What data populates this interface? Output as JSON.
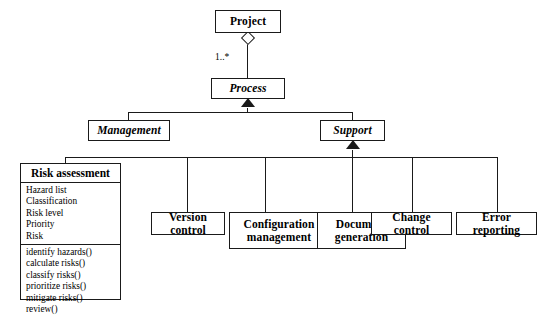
{
  "diagram": {
    "type": "uml-class-diagram",
    "classes": {
      "project": {
        "name": "Project",
        "abstract": false
      },
      "process": {
        "name": "Process",
        "abstract": true
      },
      "management": {
        "name": "Management",
        "abstract": true
      },
      "support": {
        "name": "Support",
        "abstract": true
      },
      "risk_assessment": {
        "name": "Risk assessment",
        "abstract": false,
        "attributes": [
          "Hazard list",
          "Classification",
          "Risk level",
          "Priority",
          "Risk"
        ],
        "operations": [
          "identify hazards()",
          "calculate risks()",
          "classify risks()",
          "prioritize risks()",
          "mitigate risks()",
          "review()"
        ]
      },
      "version_control": {
        "name": "Version control",
        "abstract": false
      },
      "configuration_management": {
        "name": "Configuration management",
        "line1": "Configuration",
        "line2": "management",
        "abstract": false
      },
      "document_generation": {
        "name": "Document generation",
        "line1": "Document",
        "line2": "generation",
        "abstract": false
      },
      "change_control": {
        "name": "Change control",
        "abstract": false
      },
      "error_reporting": {
        "name": "Error reporting",
        "abstract": false
      }
    },
    "relationships": {
      "aggregation_multiplicity": "1..*"
    },
    "colors": {
      "line": "#1a1a1a",
      "background": "#ffffff",
      "text": "#000000"
    }
  }
}
